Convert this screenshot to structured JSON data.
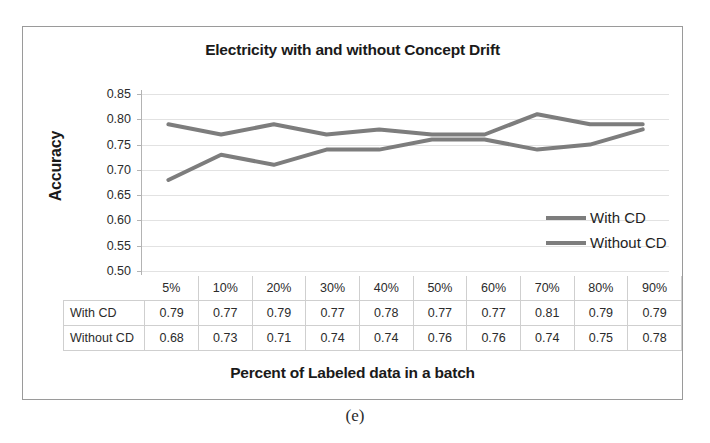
{
  "figure": {
    "caption": "(e)"
  },
  "chart_data": {
    "type": "line",
    "title": "Electricity with and without Concept Drift",
    "xlabel": "Percent of Labeled data in a batch",
    "ylabel": "Accuracy",
    "categories": [
      "5%",
      "10%",
      "20%",
      "30%",
      "40%",
      "50%",
      "60%",
      "70%",
      "80%",
      "90%"
    ],
    "series": [
      {
        "name": "With CD",
        "values": [
          0.79,
          0.77,
          0.79,
          0.77,
          0.78,
          0.77,
          0.77,
          0.81,
          0.79,
          0.79
        ],
        "color": "#7d7d7d"
      },
      {
        "name": "Without CD",
        "values": [
          0.68,
          0.73,
          0.71,
          0.74,
          0.74,
          0.76,
          0.76,
          0.74,
          0.75,
          0.78
        ],
        "color": "#7d7d7d"
      }
    ],
    "ylim": [
      0.5,
      0.85
    ],
    "ytick_labels": [
      "0.85",
      "0.80",
      "0.75",
      "0.70",
      "0.65",
      "0.60",
      "0.55",
      "0.50"
    ],
    "ytick_values": [
      0.85,
      0.8,
      0.75,
      0.7,
      0.65,
      0.6,
      0.55,
      0.5
    ],
    "grid": true,
    "legend_position": "inside-right",
    "data_table_visible": true
  },
  "table": {
    "corner_label": "",
    "column_headers": [
      "5%",
      "10%",
      "20%",
      "30%",
      "40%",
      "50%",
      "60%",
      "70%",
      "80%",
      "90%"
    ],
    "rows": [
      {
        "label": "With CD",
        "cells": [
          "0.79",
          "0.77",
          "0.79",
          "0.77",
          "0.78",
          "0.77",
          "0.77",
          "0.81",
          "0.79",
          "0.79"
        ]
      },
      {
        "label": "Without CD",
        "cells": [
          "0.68",
          "0.73",
          "0.71",
          "0.74",
          "0.74",
          "0.76",
          "0.76",
          "0.74",
          "0.75",
          "0.78"
        ]
      }
    ]
  }
}
